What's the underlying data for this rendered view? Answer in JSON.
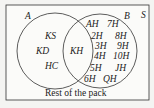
{
  "diagram": {
    "type": "venn",
    "universal_set_label": "S",
    "sets": [
      {
        "label": "A",
        "only": [
          "KS",
          "KD",
          "HC"
        ]
      },
      {
        "label": "B",
        "only": [
          "AH",
          "7H",
          "2H",
          "8H",
          "3H",
          "9H",
          "4H",
          "10H",
          "5H",
          "JH",
          "6H",
          "QH"
        ]
      }
    ],
    "intersection": [
      "KH"
    ],
    "outside_label": "Rest of the pack"
  }
}
